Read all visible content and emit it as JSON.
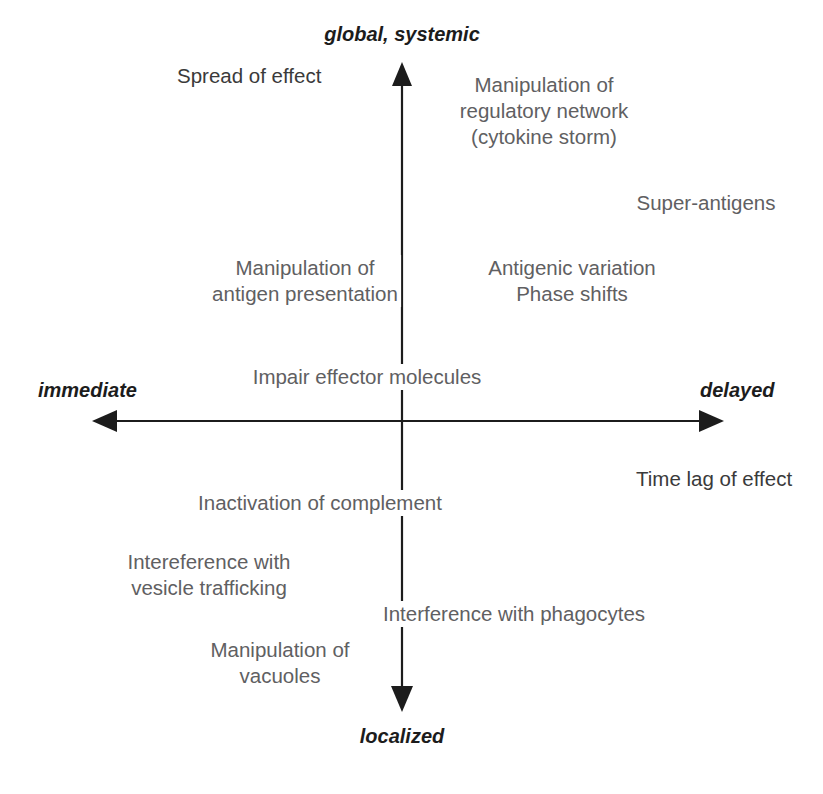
{
  "diagram": {
    "text_color": "#5f6062",
    "axis_color": "#1c1c1c",
    "background": "#ffffff"
  },
  "axes": {
    "vertical": {
      "name": "Spread of effect",
      "top_label": "global, systemic",
      "bottom_label": "localized"
    },
    "horizontal": {
      "name": "Time lag of effect",
      "left_label": "immediate",
      "right_label": "delayed"
    }
  },
  "items": {
    "regulatory_network": "Manipulation of\nregulatory network\n(cytokine storm)",
    "super_antigens": "Super-antigens",
    "antigen_presentation": "Manipulation of\nantigen presentation",
    "antigenic_variation": "Antigenic variation\nPhase shifts",
    "effector_molecules": "Impair effector molecules",
    "complement": "Inactivation of complement",
    "vesicle_trafficking": "Intereference with\nvesicle trafficking",
    "phagocytes": "Interference with phagocytes",
    "vacuoles": "Manipulation of\nvacuoles"
  }
}
